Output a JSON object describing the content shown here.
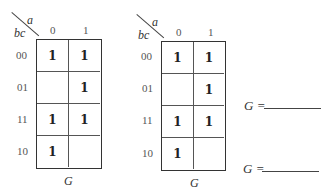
{
  "maps": [
    {
      "row_var": "bc",
      "col_var": "a",
      "col_labels": [
        "0",
        "1"
      ],
      "row_labels": [
        "00",
        "01",
        "11",
        "10"
      ],
      "cells": [
        [
          "1",
          "1"
        ],
        [
          "",
          "1"
        ],
        [
          "1",
          "1"
        ],
        [
          "1",
          ""
        ]
      ],
      "function_label": "G"
    },
    {
      "row_var": "bc",
      "col_var": "a",
      "col_labels": [
        "0",
        "1"
      ],
      "row_labels": [
        "00",
        "01",
        "11",
        "10"
      ],
      "cells": [
        [
          "1",
          "1"
        ],
        [
          "",
          "1"
        ],
        [
          "1",
          "1"
        ],
        [
          "1",
          ""
        ]
      ],
      "function_label": "G"
    }
  ],
  "answers": [
    {
      "label": "G =",
      "value": ""
    },
    {
      "label": "G =",
      "value": ""
    }
  ]
}
